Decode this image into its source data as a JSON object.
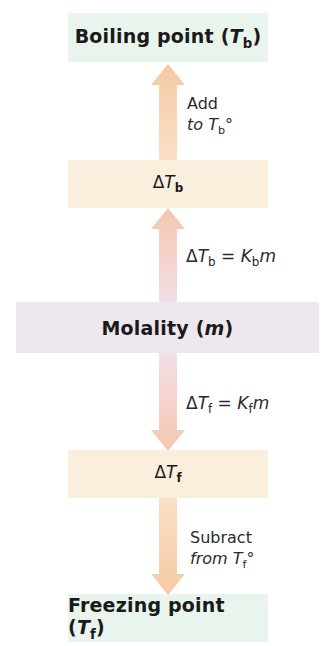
{
  "diagram": {
    "boxes": {
      "boiling": {
        "label": "Boiling point (",
        "var": "T",
        "sub": "b",
        "close": ")"
      },
      "delta_b": {
        "delta": "Δ",
        "var": "T",
        "sub": "b"
      },
      "molality": {
        "label": "Molality (",
        "var": "m",
        "close": ")"
      },
      "delta_f": {
        "delta": "Δ",
        "var": "T",
        "sub": "f"
      },
      "freezing": {
        "label": "Freezing point (",
        "var": "T",
        "sub": "f",
        "close": ")"
      }
    },
    "annotations": {
      "add": {
        "line1": "Add",
        "line2_prefix": "to ",
        "var": "T",
        "sub": "b",
        "suffix": "°"
      },
      "eq_b": {
        "delta": "Δ",
        "var": "T",
        "sub": "b",
        "eq": " = ",
        "k": "K",
        "ksub": "b",
        "m": "m"
      },
      "eq_f": {
        "delta": "Δ",
        "var": "T",
        "sub": "f",
        "eq": " = ",
        "k": "K",
        "ksub": "f",
        "m": "m"
      },
      "subtract": {
        "line1": "Subract",
        "line2_prefix": "from ",
        "var": "T",
        "sub": "f",
        "suffix": "°"
      }
    },
    "colors": {
      "green_box": "#e9f4ec",
      "peach_box": "#faeedd",
      "lavender_box": "#efe7f0",
      "arrow_peach": "#f6cfa8",
      "arrow_pink": "#f1d4d4"
    }
  }
}
